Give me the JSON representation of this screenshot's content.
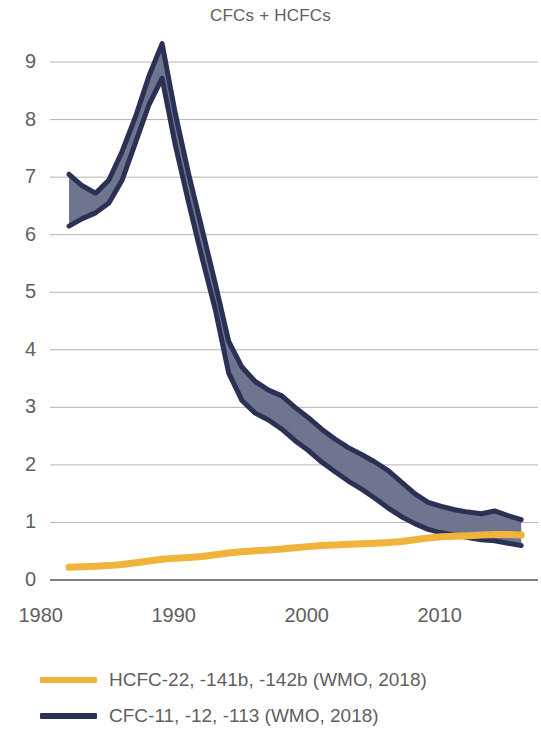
{
  "chart_data": {
    "type": "area",
    "title": "CFCs + HCFCs",
    "xlabel": "",
    "ylabel": "",
    "xlim": [
      1980,
      2016
    ],
    "ylim": [
      0,
      9.4
    ],
    "grid": true,
    "grid_axis": "y",
    "legend_position": "below",
    "x_ticks": [
      "1980",
      "1990",
      "2000",
      "2010"
    ],
    "x_tick_values": [
      1980,
      1990,
      2000,
      2010
    ],
    "y_ticks": [
      "0",
      "1",
      "2",
      "3",
      "4",
      "5",
      "6",
      "7",
      "8",
      "9"
    ],
    "y_tick_values": [
      0,
      1,
      2,
      3,
      4,
      5,
      6,
      7,
      8,
      9
    ],
    "x": [
      1981,
      1982,
      1983,
      1984,
      1985,
      1986,
      1987,
      1988,
      1989,
      1990,
      1991,
      1992,
      1993,
      1994,
      1995,
      1996,
      1997,
      1998,
      1999,
      2000,
      2001,
      2002,
      2003,
      2004,
      2005,
      2006,
      2007,
      2008,
      2009,
      2010,
      2011,
      2012,
      2013,
      2014,
      2015
    ],
    "series": [
      {
        "name": "CFC-11, -12, -113 (WMO, 2018)",
        "type": "band",
        "color": "#2b3154",
        "fill": "#6f748f",
        "upper": [
          7.05,
          6.85,
          6.72,
          6.95,
          7.45,
          8.05,
          8.75,
          9.32,
          8.1,
          7.05,
          6.1,
          5.15,
          4.15,
          3.7,
          3.45,
          3.3,
          3.2,
          3.0,
          2.82,
          2.62,
          2.45,
          2.3,
          2.18,
          2.05,
          1.9,
          1.7,
          1.5,
          1.35,
          1.28,
          1.22,
          1.18,
          1.15,
          1.2,
          1.12,
          1.05
        ],
        "lower": [
          6.15,
          6.28,
          6.38,
          6.55,
          6.95,
          7.6,
          8.25,
          8.72,
          7.55,
          6.55,
          5.6,
          4.7,
          3.6,
          3.12,
          2.9,
          2.78,
          2.62,
          2.42,
          2.25,
          2.05,
          1.88,
          1.72,
          1.58,
          1.42,
          1.25,
          1.1,
          0.98,
          0.88,
          0.82,
          0.78,
          0.74,
          0.7,
          0.68,
          0.64,
          0.6
        ]
      },
      {
        "name": "HCFC-22, -141b, -142b (WMO, 2018)",
        "type": "line",
        "color": "#f0b33c",
        "values": [
          0.22,
          0.23,
          0.24,
          0.25,
          0.27,
          0.3,
          0.33,
          0.36,
          0.38,
          0.39,
          0.41,
          0.44,
          0.47,
          0.49,
          0.51,
          0.52,
          0.54,
          0.56,
          0.58,
          0.6,
          0.61,
          0.62,
          0.63,
          0.64,
          0.65,
          0.67,
          0.7,
          0.73,
          0.75,
          0.76,
          0.77,
          0.78,
          0.79,
          0.79,
          0.78
        ]
      }
    ]
  },
  "legend": {
    "items": [
      {
        "label": "HCFC-22, -141b, -142b (WMO, 2018)",
        "color": "#f0b33c"
      },
      {
        "label": "CFC-11, -12, -113 (WMO, 2018)",
        "color": "#2b3154"
      }
    ]
  },
  "colors": {
    "cfc_line": "#2b3154",
    "cfc_fill": "#6f748f",
    "hcfc_line": "#f0b33c",
    "gridline": "#b3b3b3",
    "axis": "#808080",
    "text": "#5f5f5f"
  }
}
